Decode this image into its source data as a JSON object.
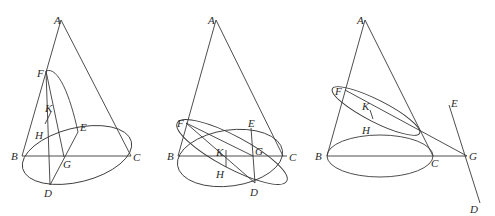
{
  "figure": {
    "panels": [
      {
        "id": "panel-1",
        "section": "parabola",
        "labels": {
          "A": "A",
          "B": "B",
          "C": "C",
          "D": "D",
          "E": "E",
          "F": "F",
          "G": "G",
          "H": "H",
          "K": "K"
        }
      },
      {
        "id": "panel-2",
        "section": "ellipse",
        "labels": {
          "A": "A",
          "B": "B",
          "C": "C",
          "D": "D",
          "E": "E",
          "F": "F",
          "G": "G",
          "H": "H",
          "K": "K"
        }
      },
      {
        "id": "panel-3",
        "section": "ellipse-with-external-line",
        "labels": {
          "A": "A",
          "B": "B",
          "C": "C",
          "D": "D",
          "E": "E",
          "F": "F",
          "G": "G",
          "H": "H",
          "K": "K"
        }
      }
    ],
    "colors": {
      "stroke": "#3a3a3a",
      "label": "#2a2a2a",
      "background": "#ffffff"
    }
  }
}
